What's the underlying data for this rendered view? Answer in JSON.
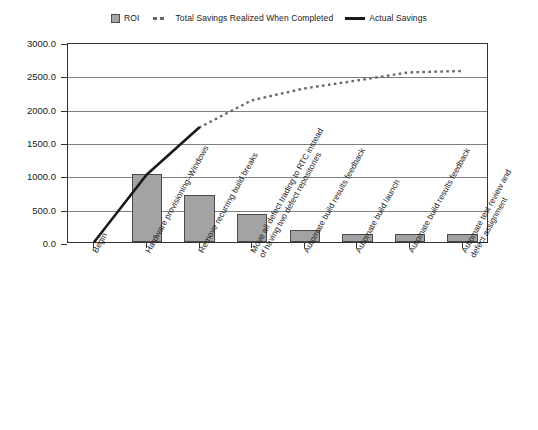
{
  "chart_data": {
    "type": "bar",
    "title": "",
    "xlabel": "",
    "ylabel": "",
    "ylim": [
      0,
      3000
    ],
    "yticks": [
      0,
      500,
      1000,
      1500,
      2000,
      2500,
      3000
    ],
    "ytick_labels": [
      "0.0",
      "500.0",
      "1000.0",
      "1500.0",
      "2000.0",
      "2500.0",
      "3000.0"
    ],
    "grid": true,
    "legend_position": "top-center",
    "legend": [
      {
        "label": "ROI",
        "marker": "bar-swatch-icon"
      },
      {
        "label": "Total Savings Realized When Completed",
        "marker": "dotted-line-icon"
      },
      {
        "label": "Actual Savings",
        "marker": "solid-line-icon"
      }
    ],
    "categories": [
      "Begin",
      "Hardware provisioning–Windows",
      "Remove recurring build breaks",
      "Move all defect trading to RTC instead\nof having two defect repositories",
      "Automate build results feedback",
      "Automate build launch",
      "Automate build results feedback",
      "Automate test review and\ndefect assignment"
    ],
    "series": [
      {
        "name": "ROI",
        "type": "bar",
        "values": [
          0,
          1020,
          710,
          415,
          180,
          120,
          125,
          115
        ]
      },
      {
        "name": "Actual Savings",
        "type": "line",
        "style": "solid",
        "values": [
          0,
          1020,
          1730,
          null,
          null,
          null,
          null,
          null
        ]
      },
      {
        "name": "Total Savings Realized When Completed",
        "type": "line",
        "style": "dotted",
        "values": [
          null,
          null,
          1730,
          2145,
          2325,
          2445,
          2570,
          2590
        ]
      }
    ],
    "colors": {
      "bar_fill": "#a3a3a3",
      "bar_edge": "#4a4a4a",
      "solid_line": "#1a1a1a",
      "dotted_line": "#666666",
      "gridline": "#808080",
      "axis": "#333333",
      "background": "#ffffff"
    }
  }
}
